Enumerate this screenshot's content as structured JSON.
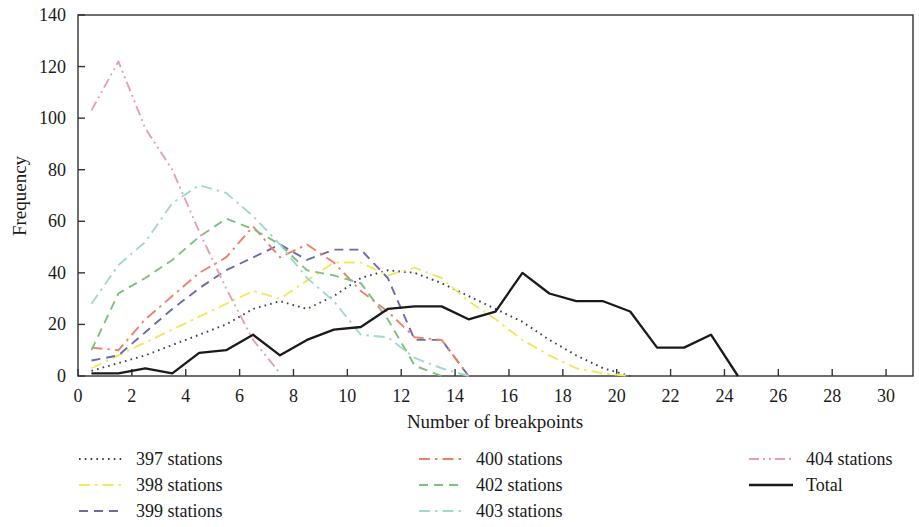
{
  "chart_data": {
    "type": "line",
    "title": "",
    "xlabel": "Number of breakpoints",
    "ylabel": "Frequency",
    "xlim": [
      0,
      31
    ],
    "ylim": [
      0,
      140
    ],
    "xticks": [
      0,
      2,
      4,
      6,
      8,
      10,
      12,
      14,
      16,
      18,
      20,
      22,
      24,
      26,
      28,
      30
    ],
    "yticks": [
      0,
      20,
      40,
      60,
      80,
      100,
      120,
      140
    ],
    "grid": false,
    "legend_position": "below",
    "series": [
      {
        "name": "397 stations",
        "color": "#3a3a5c",
        "dash": "dotted",
        "x": [
          0.5,
          1.5,
          2.5,
          3.5,
          4.5,
          5.5,
          6.5,
          7.5,
          8.5,
          9.5,
          10.5,
          11.5,
          12.5,
          13.5,
          14.5,
          15.5,
          16.5,
          17.5,
          18.5,
          19.5,
          20.5
        ],
        "y": [
          2,
          5,
          8,
          12,
          16,
          20,
          26,
          29,
          26,
          31,
          38,
          41,
          40,
          36,
          31,
          26,
          21,
          14,
          8,
          3,
          0
        ]
      },
      {
        "name": "398 stations",
        "color": "#f2e85c",
        "dash": "dashdot",
        "x": [
          0.5,
          1.5,
          2.5,
          3.5,
          4.5,
          5.5,
          6.5,
          7.5,
          8.5,
          9.5,
          10.5,
          11.5,
          12.5,
          13.5,
          14.5,
          15.5,
          16.5,
          17.5,
          18.5,
          19.5,
          20.5
        ],
        "y": [
          3,
          8,
          13,
          18,
          23,
          28,
          33,
          30,
          37,
          44,
          44,
          39,
          42,
          38,
          29,
          22,
          14,
          8,
          3,
          1,
          0
        ]
      },
      {
        "name": "399 stations",
        "color": "#6b6ba8",
        "dash": "dashed",
        "x": [
          0.5,
          1.5,
          2.5,
          3.5,
          4.5,
          5.5,
          6.5,
          7.5,
          8.5,
          9.5,
          10.5,
          11.5,
          12.5,
          13.5,
          14.5
        ],
        "y": [
          6,
          8,
          17,
          26,
          34,
          41,
          46,
          51,
          45,
          49,
          49,
          38,
          14,
          14,
          0
        ]
      },
      {
        "name": "400 stations",
        "color": "#e8836b",
        "dash": "dashdot",
        "x": [
          0.5,
          1.5,
          2.5,
          3.5,
          4.5,
          5.5,
          6.5,
          7.5,
          8.5,
          9.5,
          10.5,
          11.5,
          12.5,
          13.5,
          14.5
        ],
        "y": [
          11,
          10,
          22,
          31,
          40,
          46,
          58,
          46,
          51,
          44,
          33,
          25,
          15,
          14,
          0
        ]
      },
      {
        "name": "402 stations",
        "color": "#7fbf7f",
        "dash": "dashed",
        "x": [
          0.5,
          1.5,
          2.5,
          3.5,
          4.5,
          5.5,
          6.5,
          7.5,
          8.5,
          9.5,
          10.5,
          11.5,
          12.5,
          13.5
        ],
        "y": [
          10,
          32,
          38,
          45,
          54,
          61,
          57,
          51,
          41,
          39,
          36,
          22,
          4,
          0
        ]
      },
      {
        "name": "403 stations",
        "color": "#9fd9d2",
        "dash": "dashdot",
        "x": [
          0.5,
          1.5,
          2.5,
          3.5,
          4.5,
          5.5,
          6.5,
          7.5,
          8.5,
          9.5,
          10.5,
          11.5,
          12.5,
          13.5,
          14.5
        ],
        "y": [
          28,
          43,
          52,
          67,
          74,
          71,
          62,
          51,
          38,
          29,
          16,
          15,
          7,
          3,
          0
        ]
      },
      {
        "name": "404 stations",
        "color": "#e8a0b0",
        "dash": "dashdotdot",
        "x": [
          0.5,
          1.5,
          2.5,
          3.5,
          4.5,
          5.5,
          6.5,
          7.5
        ],
        "y": [
          103,
          122,
          96,
          80,
          56,
          34,
          14,
          1
        ]
      },
      {
        "name": "Total",
        "color": "#1a1a1a",
        "dash": "solid",
        "x": [
          0.5,
          1.5,
          2.5,
          3.5,
          4.5,
          5.5,
          6.5,
          7.5,
          8.5,
          9.5,
          10.5,
          11.5,
          12.5,
          13.5,
          14.5,
          15.5,
          16.5,
          17.5,
          18.5,
          19.5,
          20.5,
          21.5,
          22.5,
          23.5,
          24.5
        ],
        "y": [
          1,
          1,
          3,
          1,
          9,
          10,
          16,
          8,
          14,
          18,
          19,
          26,
          27,
          27,
          22,
          25,
          40,
          32,
          29,
          29,
          25,
          11,
          11,
          16,
          0
        ]
      }
    ]
  },
  "axes": {
    "x_title": "Number of breakpoints",
    "y_title": "Frequency",
    "x_tick_labels": [
      "0",
      "2",
      "4",
      "6",
      "8",
      "10",
      "12",
      "14",
      "16",
      "18",
      "20",
      "22",
      "24",
      "26",
      "28",
      "30"
    ],
    "y_tick_labels": [
      "0",
      "20",
      "40",
      "60",
      "80",
      "100",
      "120",
      "140"
    ]
  },
  "legend": {
    "items": [
      {
        "label": "397 stations",
        "color": "#3a3a5c",
        "dash": "dotted"
      },
      {
        "label": "398 stations",
        "color": "#f2e85c",
        "dash": "dashdot"
      },
      {
        "label": "399 stations",
        "color": "#6b6ba8",
        "dash": "dashed"
      },
      {
        "label": "400 stations",
        "color": "#e8836b",
        "dash": "dashdot"
      },
      {
        "label": "402 stations",
        "color": "#7fbf7f",
        "dash": "dashed"
      },
      {
        "label": "403 stations",
        "color": "#9fd9d2",
        "dash": "dashdot"
      },
      {
        "label": "404 stations",
        "color": "#e8a0b0",
        "dash": "dashdotdot"
      },
      {
        "label": "Total",
        "color": "#1a1a1a",
        "dash": "solid"
      }
    ]
  }
}
